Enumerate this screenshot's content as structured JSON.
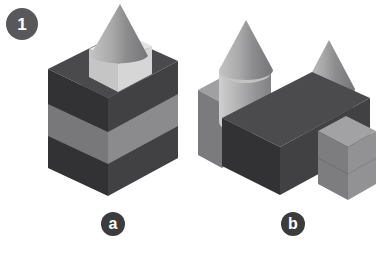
{
  "page": {
    "background": "#ffffff",
    "width": 384,
    "height": 256,
    "kind": "block-construction-comparison"
  },
  "question": {
    "number": "1"
  },
  "labels": {
    "a": "a",
    "b": "b"
  },
  "palette": {
    "badge_gray": "#58585a",
    "label_gray": "#3c3c3e",
    "dark_top": "#4a4a4c",
    "dark_left": "#333335",
    "dark_right": "#3f3f41",
    "mid_top": "#9a9a9c",
    "mid_left": "#77777a",
    "mid_right": "#8a8a8c",
    "light_top": "#e2e2e2",
    "light_left": "#c6c6c6",
    "light_right": "#d4d4d4",
    "cone_light": "#b8b8b8",
    "cone_dark": "#7c7c7e",
    "cyl_light": "#c8c8c8",
    "cyl_dark": "#88888a",
    "outline": "#6d6d70"
  },
  "figures": [
    {
      "id": "a",
      "label": "a",
      "description": "Tall narrow stack of rectangular blocks topped by a light cube and a grey cone",
      "parts": [
        {
          "name": "bottom-dark-block",
          "shape": "rectangular-prism",
          "color": "dark",
          "count": 1
        },
        {
          "name": "middle-light-block",
          "shape": "rectangular-prism",
          "color": "mid",
          "count": 1
        },
        {
          "name": "upper-dark-block",
          "shape": "rectangular-prism",
          "color": "dark",
          "count": 1
        },
        {
          "name": "top-cube",
          "shape": "cube",
          "color": "light",
          "count": 1
        },
        {
          "name": "cone",
          "shape": "cone",
          "color": "grey",
          "count": 1
        }
      ],
      "counts": {
        "blocks": 3,
        "cubes": 1,
        "cylinders": 0,
        "cones": 1
      }
    },
    {
      "id": "b",
      "label": "b",
      "description": "Wide low wall of blocks with two cylinders each topped by a grey cone",
      "parts": [
        {
          "name": "left-light-block",
          "shape": "rectangular-prism",
          "color": "mid",
          "count": 1
        },
        {
          "name": "long-dark-block",
          "shape": "rectangular-prism",
          "color": "dark",
          "count": 1
        },
        {
          "name": "right-light-block",
          "shape": "rectangular-prism",
          "color": "mid",
          "count": 1
        },
        {
          "name": "left-cylinder",
          "shape": "cylinder",
          "color": "grey",
          "count": 1
        },
        {
          "name": "right-cylinder",
          "shape": "cylinder",
          "color": "grey",
          "count": 1
        },
        {
          "name": "left-cone",
          "shape": "cone",
          "color": "grey",
          "count": 1
        },
        {
          "name": "right-cone",
          "shape": "cone",
          "color": "grey",
          "count": 1
        }
      ],
      "counts": {
        "blocks": 3,
        "cubes": 0,
        "cylinders": 2,
        "cones": 2
      }
    }
  ]
}
